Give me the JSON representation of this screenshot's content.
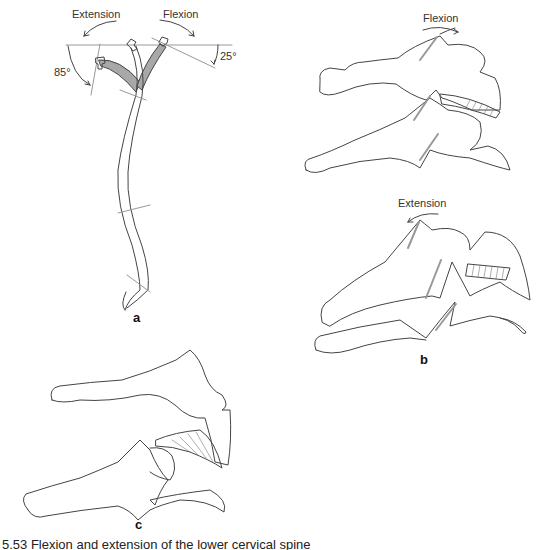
{
  "figure": {
    "panel_a": {
      "label": "a",
      "extension_label": "Extension",
      "flexion_label": "Flexion",
      "extension_angle": "85°",
      "flexion_angle": "25°"
    },
    "panel_b": {
      "label": "b",
      "flexion_label": "Flexion",
      "extension_label": "Extension"
    },
    "panel_c": {
      "label": "c"
    },
    "caption": "5.53  Flexion and extension of the lower cervical spine"
  },
  "colors": {
    "line": "#444444",
    "gray_fill": "#a8a8a8",
    "ref_line": "#999999",
    "hatch": "#777777"
  }
}
